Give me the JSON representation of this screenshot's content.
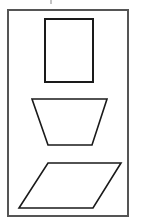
{
  "figure": {
    "width": 144,
    "height": 224,
    "background": "#ffffff",
    "stroke_color": "#1a1a1a",
    "frame_color": "#555555",
    "frame": {
      "x": 8,
      "y": 10,
      "w": 120,
      "h": 206
    },
    "shapes": [
      {
        "name": "rectangle",
        "points": "45,19 93,19 93,82 45,82"
      },
      {
        "name": "trapezoid",
        "points": "32,99 107,99 92,145 48,145"
      },
      {
        "name": "parallelogram",
        "points": "48,163 121,163 93,208 19,208"
      }
    ],
    "top_mark": {
      "x1": 51,
      "y1": 0,
      "x2": 51,
      "y2": 4
    }
  }
}
